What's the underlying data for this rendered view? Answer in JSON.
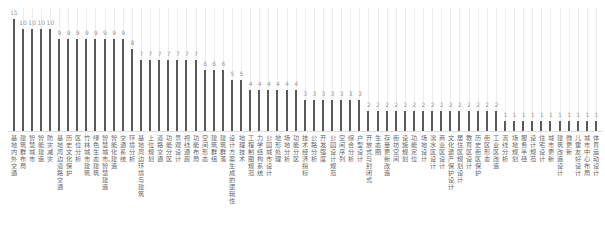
{
  "chart_data": {
    "type": "bar",
    "title": "",
    "xlabel": "",
    "ylabel": "",
    "ylim": [
      0,
      11
    ],
    "grid": true,
    "legend": null,
    "bar_color": "#5a5a5a",
    "categories": [
      "基地内外交通",
      "建筑群布局",
      "智慧城市",
      "智能建造",
      "防灾减灾",
      "基地周边道路交通",
      "历史文化保护",
      "区位分析",
      "竹林城市建筑",
      "绿色生态建筑",
      "智慧城市、智慧建造",
      "智能化建造",
      "交通系统",
      "环境分析",
      "基地周边环境与建筑",
      "上位规划",
      "道路交通",
      "功能分区",
      "景观设计",
      "视线通廊",
      "功能布局",
      "空间形态",
      "建筑群组",
      "建筑群落",
      "设计方案生成的逻辑性",
      "地理技术",
      "工程制图规范",
      "力学结构系统",
      "公园城市设计",
      "地形处理",
      "场地分析",
      "功能分区",
      "技术经济指标",
      "公路分析",
      "开发强度",
      "公园设计规范",
      "空间序列",
      "综合分析",
      "户型设计",
      "开放式与封闭式",
      "生态圈",
      "存量更新改造",
      "街坊空间",
      "设施规划",
      "功能定位",
      "场地设计",
      "滨水区设计",
      "商业区设计",
      "文化遗产保护设计",
      "居住区规划设计",
      "教育区设计",
      "历史街区保护",
      "街区形态",
      "工业区改造",
      "流线分析",
      "场地规划",
      "服务半径",
      "设计规范",
      "住宅设计",
      "城市更新",
      "建筑改造设计",
      "微更新",
      "儿童友好设计",
      "城市中心布局",
      "体育运动设计"
    ],
    "values": [
      11,
      10,
      10,
      10,
      10,
      9,
      9,
      9,
      9,
      9,
      9,
      9,
      9,
      8,
      7,
      7,
      7,
      7,
      7,
      7,
      7,
      6,
      6,
      6,
      5,
      5,
      4,
      4,
      4,
      4,
      4,
      4,
      3,
      3,
      3,
      3,
      3,
      3,
      3,
      2,
      2,
      2,
      2,
      2,
      2,
      2,
      2,
      2,
      2,
      2,
      2,
      2,
      2,
      2,
      1,
      1,
      1,
      1,
      1,
      1,
      1,
      1,
      1,
      1,
      1
    ]
  }
}
